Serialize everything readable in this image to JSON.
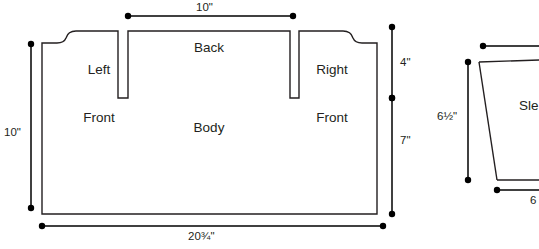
{
  "diagram": {
    "stroke_color": "#231f20",
    "background_color": "#ffffff",
    "pieces": [
      {
        "id": "body",
        "name": "body-piece",
        "labels": [
          {
            "id": "left-front",
            "text": "Left\nFront",
            "line1": "Left",
            "line2": "Front",
            "x": 99,
            "y": 32
          },
          {
            "id": "back",
            "text": "Back",
            "line1": "Back",
            "line2": "",
            "x": 208,
            "y": 42
          },
          {
            "id": "right-front",
            "text": "Right\nFront",
            "line1": "Right",
            "line2": "Front",
            "x": 330,
            "y": 32
          },
          {
            "id": "body",
            "text": "Body",
            "line1": "Body",
            "line2": "",
            "x": 209,
            "y": 123
          }
        ],
        "dimensions": [
          {
            "id": "top-width",
            "value": "10\"",
            "orientation": "horizontal",
            "x1": 128,
            "y1": 16,
            "x2": 293,
            "y2": 16,
            "label_x": 210,
            "label_y": 4
          },
          {
            "id": "left-height",
            "value": "10\"",
            "orientation": "vertical",
            "x1": 31,
            "y1": 44,
            "x2": 31,
            "y2": 208,
            "label_x": 6,
            "label_y": 132
          },
          {
            "id": "right-upper",
            "value": "4\"",
            "orientation": "vertical",
            "x1": 392,
            "y1": 27,
            "x2": 392,
            "y2": 98,
            "label_x": 400,
            "label_y": 63
          },
          {
            "id": "right-lower",
            "value": "7\"",
            "orientation": "vertical",
            "x1": 392,
            "y1": 98,
            "x2": 392,
            "y2": 214,
            "label_x": 400,
            "label_y": 140
          },
          {
            "id": "bottom-width",
            "value": "20¾\"",
            "orientation": "horizontal",
            "x1": 42,
            "y1": 226,
            "x2": 383,
            "y2": 226,
            "label_x": 190,
            "label_y": 232
          }
        ]
      },
      {
        "id": "sleeve",
        "name": "sleeve-piece",
        "labels": [
          {
            "id": "sleeve",
            "text": "Sle",
            "line1": "Sle",
            "line2": "",
            "x": 519,
            "y": 101
          }
        ],
        "dimensions": [
          {
            "id": "sleeve-top",
            "value": "",
            "orientation": "horizontal",
            "x1": 483,
            "y1": 46,
            "x2": 539,
            "y2": 46,
            "label_x": 539,
            "label_y": 34
          },
          {
            "id": "sleeve-height",
            "value": "6½\"",
            "orientation": "vertical",
            "x1": 468,
            "y1": 62,
            "x2": 468,
            "y2": 180,
            "label_x": 437,
            "label_y": 116
          },
          {
            "id": "sleeve-bottom",
            "value": "6",
            "orientation": "horizontal",
            "x1": 497,
            "y1": 190,
            "x2": 539,
            "y2": 190,
            "label_x": 525,
            "label_y": 198
          }
        ]
      }
    ]
  }
}
